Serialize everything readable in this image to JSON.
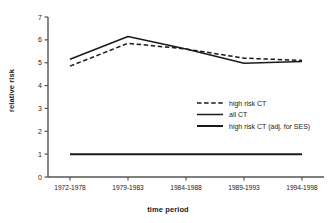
{
  "chart_data": {
    "type": "line",
    "title": "",
    "xlabel": "time period",
    "ylabel": "relative risk",
    "categories": [
      "1972-1978",
      "1979-1983",
      "1984-1988",
      "1989-1993",
      "1994-1998"
    ],
    "ylim": [
      0,
      7
    ],
    "yticks": [
      "0",
      "1",
      "2",
      "3",
      "4",
      "5",
      "6",
      "7"
    ],
    "grid": false,
    "legend_position": "center-right",
    "series": [
      {
        "name": "high risk CT",
        "style": "dashed",
        "color": "#1a1a1a",
        "values": [
          4.85,
          5.85,
          5.6,
          5.2,
          5.1
        ]
      },
      {
        "name": "all CT",
        "style": "solid-thin",
        "color": "#1a1a1a",
        "values": [
          5.15,
          6.15,
          5.6,
          4.98,
          5.05
        ]
      },
      {
        "name": "high risk CT (adj. for SES)",
        "style": "solid-thick",
        "color": "#1a1a1a",
        "values": [
          1.0,
          1.0,
          1.0,
          1.0,
          1.0
        ]
      }
    ]
  }
}
